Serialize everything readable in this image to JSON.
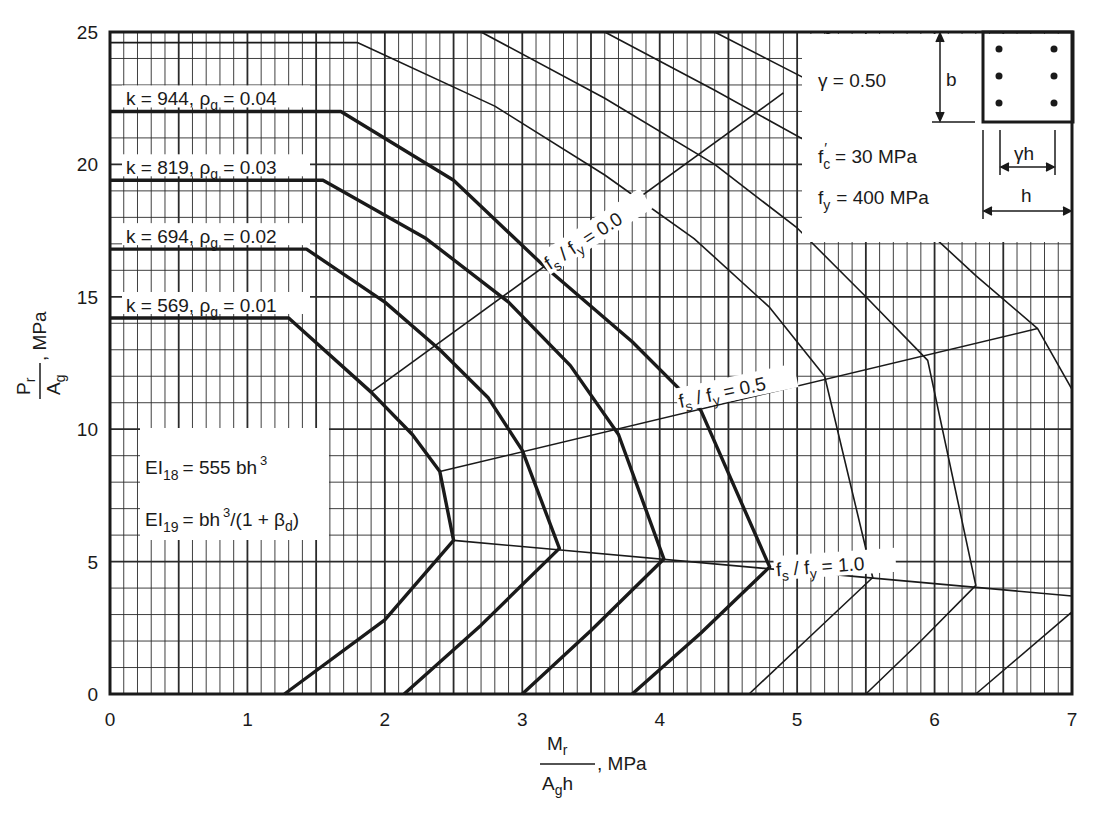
{
  "chart_data": {
    "type": "line",
    "title": "",
    "xlabel": "Mr / (Ag h), MPa",
    "ylabel": "Pr / Ag, MPa",
    "xlabel_parts": {
      "num": "M",
      "num_sub": "r",
      "den": "A",
      "den_sub": "g",
      "den_tail": "h",
      "unit": ", MPa"
    },
    "ylabel_parts": {
      "num": "P",
      "num_sub": "r",
      "den": "A",
      "den_sub": "g",
      "unit": ", MPa"
    },
    "xlim": [
      0,
      7
    ],
    "ylim": [
      0,
      25
    ],
    "xticks": [
      "0",
      "1",
      "2",
      "3",
      "4",
      "5",
      "6",
      "7"
    ],
    "yticks": [
      "0",
      "5",
      "10",
      "15",
      "20",
      "25"
    ],
    "grid": {
      "minor_x": 0.1,
      "major_x": 0.5,
      "minor_y": 1,
      "major_y": 5
    },
    "series": [
      {
        "name": "k = 569, ρg = 0.01",
        "k": "569",
        "rho": "0.01",
        "weight": "thick",
        "points": [
          [
            0,
            14.2
          ],
          [
            1.3,
            14.2
          ],
          [
            1.9,
            11.4
          ],
          [
            2.2,
            9.8
          ],
          [
            2.4,
            8.4
          ],
          [
            2.5,
            5.8
          ],
          [
            2.0,
            2.8
          ],
          [
            1.27,
            0
          ]
        ]
      },
      {
        "name": "k = 694, ρg = 0.02",
        "k": "694",
        "rho": "0.02",
        "weight": "thick",
        "points": [
          [
            0,
            16.8
          ],
          [
            1.43,
            16.8
          ],
          [
            2.0,
            14.8
          ],
          [
            2.4,
            13.0
          ],
          [
            2.75,
            11.2
          ],
          [
            3.0,
            9.2
          ],
          [
            3.27,
            5.5
          ],
          [
            2.7,
            2.6
          ],
          [
            2.14,
            0
          ]
        ]
      },
      {
        "name": "k = 819, ρg = 0.03",
        "k": "819",
        "rho": "0.03",
        "weight": "thick",
        "points": [
          [
            0,
            19.4
          ],
          [
            1.55,
            19.4
          ],
          [
            2.3,
            17.2
          ],
          [
            2.9,
            14.8
          ],
          [
            3.35,
            12.4
          ],
          [
            3.7,
            9.8
          ],
          [
            4.03,
            5.1
          ],
          [
            3.5,
            2.4
          ],
          [
            3.0,
            0
          ]
        ]
      },
      {
        "name": "k = 944, ρg = 0.04",
        "k": "944",
        "rho": "0.04",
        "weight": "thick",
        "points": [
          [
            0,
            22.0
          ],
          [
            1.68,
            22.0
          ],
          [
            2.5,
            19.4
          ],
          [
            3.15,
            16.2
          ],
          [
            3.8,
            13.3
          ],
          [
            4.3,
            10.7
          ],
          [
            4.8,
            4.8
          ],
          [
            4.3,
            2.3
          ],
          [
            3.8,
            0
          ]
        ]
      },
      {
        "name": "thin-1",
        "weight": "thin",
        "points": [
          [
            0,
            24.6
          ],
          [
            1.8,
            24.6
          ],
          [
            2.8,
            22.2
          ],
          [
            3.6,
            19.6
          ],
          [
            4.25,
            17.2
          ],
          [
            4.8,
            14.6
          ],
          [
            5.2,
            12.0
          ],
          [
            5.55,
            4.4
          ],
          [
            5.1,
            2.2
          ],
          [
            4.65,
            0
          ]
        ]
      },
      {
        "name": "thin-2",
        "weight": "thin",
        "points": [
          [
            2.7,
            25
          ],
          [
            3.6,
            22.5
          ],
          [
            4.4,
            20.0
          ],
          [
            5.0,
            17.6
          ],
          [
            5.5,
            15.0
          ],
          [
            5.95,
            12.6
          ],
          [
            6.3,
            4.1
          ],
          [
            5.9,
            2.0
          ],
          [
            5.5,
            0
          ]
        ]
      },
      {
        "name": "thin-3",
        "weight": "thin",
        "points": [
          [
            3.6,
            25
          ],
          [
            4.4,
            22.8
          ],
          [
            5.2,
            20.5
          ],
          [
            5.8,
            18.2
          ],
          [
            6.3,
            15.8
          ],
          [
            6.75,
            13.8
          ],
          [
            7.0,
            11.5
          ]
        ]
      },
      {
        "name": "thin-4",
        "weight": "thin",
        "points": [
          [
            4.4,
            25
          ],
          [
            5.0,
            23.4
          ],
          [
            5.6,
            21.8
          ],
          [
            6.2,
            20.0
          ],
          [
            6.7,
            18.3
          ],
          [
            7.0,
            17.2
          ]
        ]
      },
      {
        "name": "thin-5",
        "weight": "thin",
        "points": [
          [
            5.2,
            25
          ],
          [
            5.7,
            23.8
          ],
          [
            6.3,
            22.3
          ],
          [
            7.0,
            20.6
          ]
        ]
      },
      {
        "name": "thin-6",
        "weight": "thin",
        "points": [
          [
            6.3,
            0
          ],
          [
            7.0,
            3.1
          ]
        ]
      }
    ],
    "reference_lines": [
      {
        "label_main": "f",
        "label_sub1": "s",
        "label_mid": " / f",
        "label_sub2": "y",
        "label_tail": " = 0.0",
        "value": "0.0",
        "points": [
          [
            1.9,
            11.4
          ],
          [
            4.9,
            22.7
          ]
        ]
      },
      {
        "label_main": "f",
        "label_sub1": "s",
        "label_mid": " / f",
        "label_sub2": "y",
        "label_tail": " = 0.5",
        "value": "0.5",
        "points": [
          [
            2.4,
            8.4
          ],
          [
            6.75,
            13.8
          ]
        ]
      },
      {
        "label_main": "f",
        "label_sub1": "s",
        "label_mid": " / f",
        "label_sub2": "y",
        "label_tail": " = 1.0",
        "value": "1.0",
        "points": [
          [
            2.5,
            5.8
          ],
          [
            7.0,
            3.7
          ]
        ]
      }
    ],
    "annotations": {
      "gamma": "γ  = 0.50",
      "fc": "= 30  MPa",
      "fy": "= 400  MPa",
      "dim_b": "b",
      "dim_gh": "γh",
      "dim_h": "h",
      "ei18_lhs": "EI",
      "ei18_sub": "18",
      "ei18_rhs": "= 555 bh",
      "ei18_exp": "3",
      "ei19_lhs": "EI",
      "ei19_sub": "19",
      "ei19_rhs": "= bh",
      "ei19_exp": "3",
      "ei19_tail": "/(1 + β",
      "ei19_tail_sub": "d",
      "ei19_close": ")"
    },
    "colors": {
      "line": "#1a1a1a",
      "grid": "#2a2a2a",
      "background": "#ffffff"
    }
  }
}
